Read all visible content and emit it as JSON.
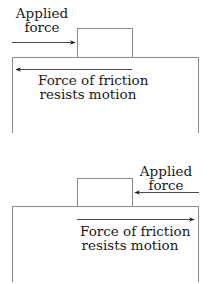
{
  "diagrams": [
    {
      "name": "push-right",
      "applied_force": {
        "line1": "Applied",
        "line2": "force",
        "direction": "right"
      },
      "friction": {
        "line1": "Force of friction",
        "line2": "resists motion",
        "direction": "left"
      }
    },
    {
      "name": "push-left",
      "applied_force": {
        "line1": "Applied",
        "line2": "force",
        "direction": "left"
      },
      "friction": {
        "line1": "Force of friction",
        "line2": "resists motion",
        "direction": "right"
      }
    }
  ],
  "colors": {
    "line": "#8a8a8a",
    "arrow": "#1a1a1a",
    "text": "#1a1a1a"
  }
}
